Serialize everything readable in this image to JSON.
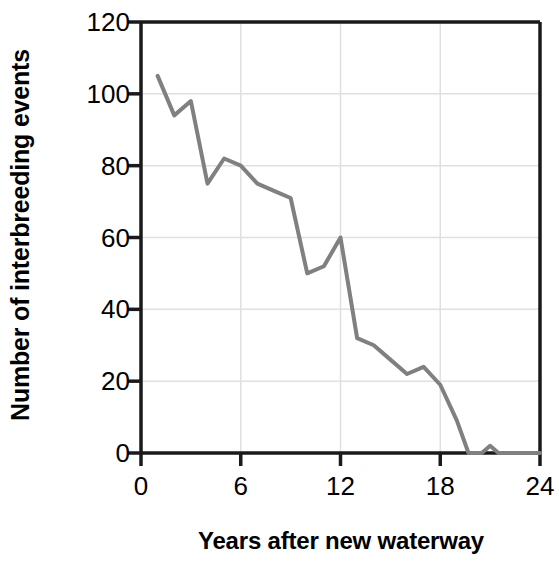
{
  "chart_data": {
    "type": "line",
    "title": "",
    "xlabel": "Years after new waterway",
    "ylabel": "Number of interbreeding events",
    "xlim": [
      0,
      24
    ],
    "ylim": [
      0,
      120
    ],
    "xticks": [
      0,
      6,
      12,
      18,
      24
    ],
    "xtick_labels": [
      "0",
      "6",
      "12",
      "18",
      "24"
    ],
    "yticks": [
      0,
      20,
      40,
      60,
      80,
      100,
      120
    ],
    "ytick_labels": [
      "0",
      "20",
      "40",
      "60",
      "80",
      "100",
      "120"
    ],
    "grid": true,
    "legend": null,
    "series": [
      {
        "name": "Interbreeding events",
        "color": "#808080",
        "line_width": 4,
        "x": [
          1,
          2,
          3,
          4,
          5,
          6,
          7,
          8,
          9,
          10,
          11,
          12,
          13,
          14,
          15,
          16,
          17,
          18,
          19,
          19.7,
          20.5,
          21,
          21.5,
          22,
          24
        ],
        "values": [
          105,
          94,
          98,
          75,
          82,
          80,
          75,
          73,
          71,
          50,
          52,
          60,
          32,
          30,
          26,
          22,
          24,
          19,
          9,
          0,
          0,
          2,
          0,
          0,
          0
        ]
      }
    ]
  },
  "axes": {
    "y_title": "Number of interbreeding events",
    "x_title": "Years after new waterway",
    "axis_color": "#1a1a1a",
    "grid_color": "#e0e0e0",
    "line_color": "#808080",
    "background": "#ffffff"
  }
}
